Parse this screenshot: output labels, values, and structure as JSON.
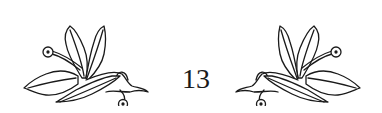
{
  "page": {
    "number": "13",
    "ornaments": [
      "floral-leaf-ornament-left",
      "floral-leaf-ornament-right"
    ],
    "ink_color": "#1a1a1a",
    "background_color": "#ffffff"
  }
}
